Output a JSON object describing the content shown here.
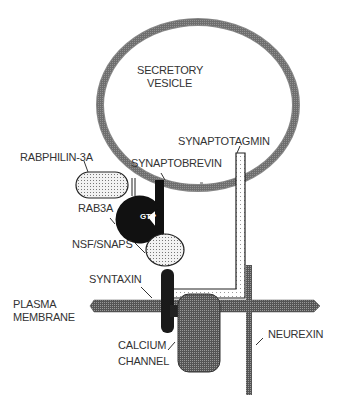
{
  "diagram": {
    "labels": {
      "vesicle_line1": "SECRETORY",
      "vesicle_line2": "VESICLE",
      "synaptotagmin": "SYNAPTOTAGMIN",
      "rabphilin": "RABPHILIN-3A",
      "synaptobrevin": "SYNAPTOBREVIN",
      "rab3a": "RAB3A",
      "gtp": "GTP",
      "nsf": "NSF/SNAPS",
      "syntaxin": "SYNTAXIN",
      "plasma_line1": "PLASMA",
      "plasma_line2": "MEMBRANE",
      "calcium_line1": "CALCIUM",
      "calcium_line2": "CHANNEL",
      "neurexin": "NEUREXIN"
    }
  }
}
